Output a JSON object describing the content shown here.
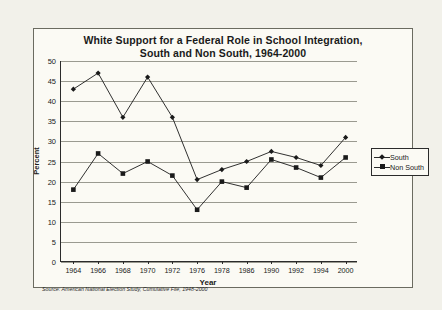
{
  "chart_data": {
    "type": "line",
    "title": "White Support for a Federal Role in School Integration, South and Non South, 1964-2000",
    "title_line1": "White Support for a Federal Role in School Integration,",
    "title_line2": "South and Non South, 1964-2000",
    "xlabel": "Year",
    "ylabel": "Percent",
    "categories": [
      "1964",
      "1966",
      "1968",
      "1970",
      "1972",
      "1976",
      "1978",
      "1986",
      "1990",
      "1992",
      "1994",
      "2000"
    ],
    "ylim": [
      0,
      50
    ],
    "yticks": [
      0,
      5,
      10,
      15,
      20,
      25,
      30,
      35,
      40,
      45,
      50
    ],
    "grid": true,
    "legend_position": "right",
    "series": [
      {
        "name": "South",
        "marker": "diamond",
        "color": "#1a1a1a",
        "values": [
          43,
          47,
          36,
          46,
          36,
          20.5,
          23,
          25,
          27.5,
          26,
          24,
          31
        ]
      },
      {
        "name": "Non South",
        "marker": "square",
        "color": "#1a1a1a",
        "values": [
          18,
          27,
          22,
          25,
          21.5,
          13,
          20,
          18.5,
          25.5,
          23.5,
          21,
          26
        ]
      }
    ],
    "source": "Source:  American National Election Study, Cumulative File, 1948-2000"
  }
}
